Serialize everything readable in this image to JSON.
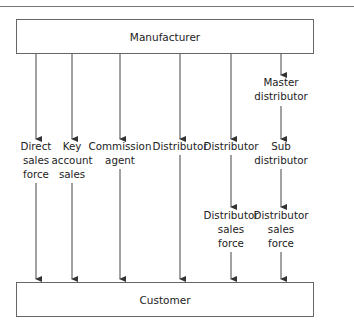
{
  "diagram": {
    "top_box": {
      "label": "Manufacturer"
    },
    "bottom_box": {
      "label": "Customer"
    },
    "channels": [
      {
        "id": "direct",
        "x": 36,
        "nodes": [
          {
            "lines": [
              "Direct",
              "sales",
              "force"
            ]
          }
        ]
      },
      {
        "id": "key-account",
        "x": 72,
        "nodes": [
          {
            "lines": [
              "Key",
              "account",
              "sales"
            ]
          }
        ]
      },
      {
        "id": "commission",
        "x": 120,
        "nodes": [
          {
            "lines": [
              "Commission",
              "agent"
            ]
          }
        ]
      },
      {
        "id": "distributor",
        "x": 180,
        "nodes": [
          {
            "lines": [
              "Distributor"
            ]
          }
        ]
      },
      {
        "id": "distributor-sf",
        "x": 231,
        "nodes": [
          {
            "lines": [
              "Distributor"
            ]
          },
          {
            "lines": [
              "Distributor",
              "sales",
              "force"
            ]
          }
        ]
      },
      {
        "id": "master",
        "x": 281,
        "nodes": [
          {
            "lines": [
              "Master",
              "distributor"
            ]
          },
          {
            "lines": [
              "Sub",
              "distributor"
            ]
          },
          {
            "lines": [
              "Distributor",
              "sales",
              "force"
            ]
          }
        ]
      }
    ]
  },
  "labels": {
    "direct": [
      "Direct",
      "sales",
      "force"
    ],
    "key_account": [
      "Key",
      "account",
      "sales"
    ],
    "commission": [
      "Commission",
      "agent"
    ],
    "distributor_1": [
      "Distributor"
    ],
    "distributor_2": [
      "Distributor"
    ],
    "master": [
      "Master",
      "distributor"
    ],
    "sub": [
      "Sub",
      "distributor"
    ],
    "dsf_1": [
      "Distributor",
      "sales",
      "force"
    ],
    "dsf_2": [
      "Distributor",
      "sales",
      "force"
    ]
  }
}
